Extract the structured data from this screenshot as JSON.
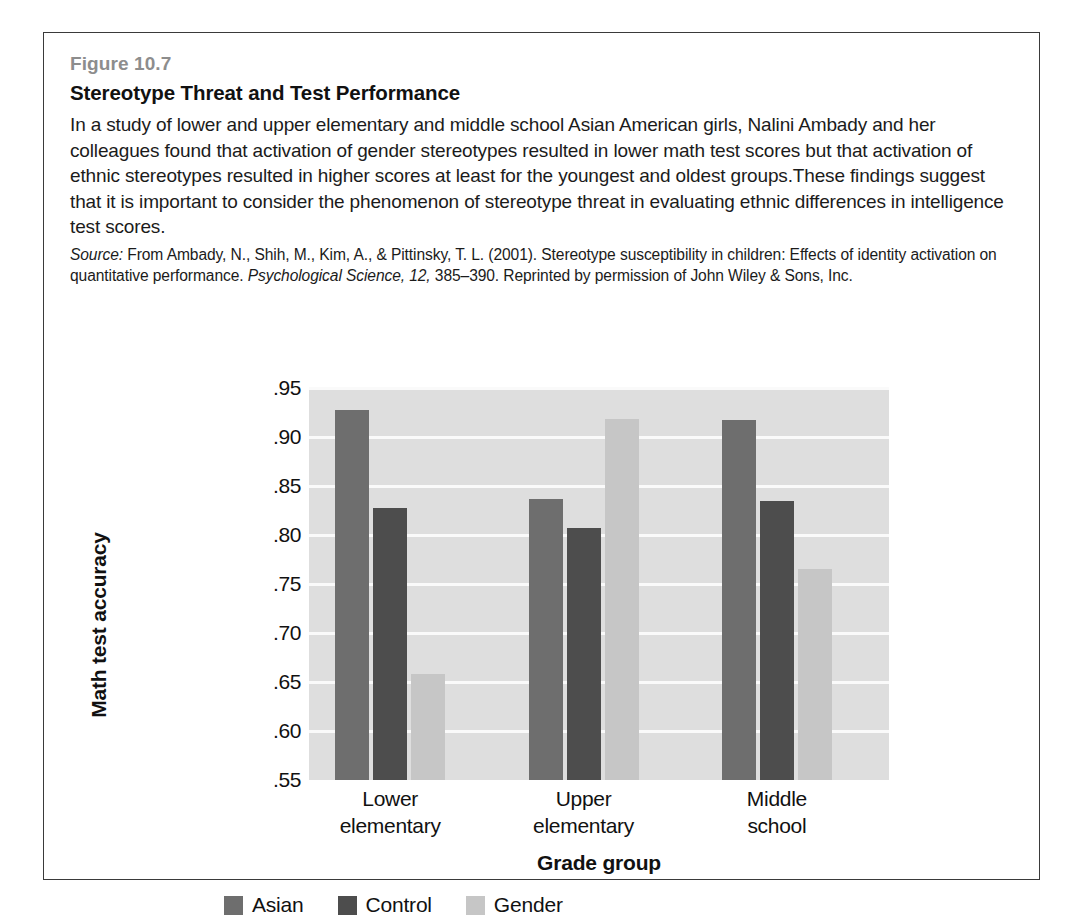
{
  "figure": {
    "number": "Figure 10.7",
    "title": "Stereotype Threat and Test Performance",
    "body": "In a study of lower and upper elementary and middle school Asian American girls, Nalini Ambady and her colleagues found that activation of gender stereotypes resulted in lower math test scores but that activation of ethnic stereotypes resulted in higher scores at least for the youngest and oldest groups.These findings suggest that it is important to consider the phenomenon of stereotype threat in evaluating ethnic differences in intelligence test scores.",
    "source_label": "Source:",
    "source_part1": " From Ambady, N., Shih, M., Kim, A., & Pittinsky, T. L. (2001). Stereotype susceptibility in children: Effects of identity activation on quantitative performance. ",
    "source_journal": "Psychological Science, 12,",
    "source_part2": " 385–390. Reprinted by permission of John Wiley & Sons, Inc."
  },
  "chart_data": {
    "type": "bar",
    "title": "Stereotype Threat and Test Performance",
    "xlabel": "Grade group",
    "ylabel": "Math test accuracy",
    "categories": [
      "Lower elementary",
      "Upper elementary",
      "Middle school"
    ],
    "category_lines": [
      [
        "Lower",
        "elementary"
      ],
      [
        "Upper",
        "elementary"
      ],
      [
        "Middle",
        "school"
      ]
    ],
    "series": [
      {
        "name": "Asian",
        "color": "#6e6e6e",
        "values": [
          0.928,
          0.837,
          0.917
        ]
      },
      {
        "name": "Control",
        "color": "#4d4d4d",
        "values": [
          0.828,
          0.807,
          0.835
        ]
      },
      {
        "name": "Gender",
        "color": "#c6c6c6",
        "values": [
          0.658,
          0.918,
          0.765
        ]
      }
    ],
    "ylim": [
      0.55,
      0.95
    ],
    "ytick_values": [
      0.95,
      0.9,
      0.85,
      0.8,
      0.75,
      0.7,
      0.65,
      0.6,
      0.55
    ],
    "ytick_labels": [
      ".95",
      ".90",
      ".85",
      ".80",
      ".75",
      ".70",
      ".65",
      ".60",
      ".55"
    ],
    "grid": true,
    "legend_position": "bottom",
    "plot_background": "#dedede",
    "gridline_color": "#fafafa"
  }
}
